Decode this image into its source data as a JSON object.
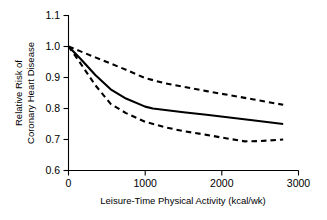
{
  "chart_data": {
    "type": "line",
    "title": "",
    "xlabel": "Leisure-Time Physical Activity (kcal/wk)",
    "ylabel": "Relative Risk of Coronary Heart Disease",
    "ylabel_line1": "Relative Risk of",
    "ylabel_line2": "Coronary Heart Disease",
    "xlim": [
      0,
      3000
    ],
    "ylim": [
      0.6,
      1.1
    ],
    "xticks": [
      0,
      1000,
      2000,
      3000
    ],
    "xticklabels": [
      "0",
      "1000",
      "2000",
      "3000"
    ],
    "yticks": [
      0.6,
      0.7,
      0.8,
      0.9,
      1.0,
      1.1
    ],
    "yticklabels": [
      "0.6",
      "0.7",
      "0.8",
      "0.9",
      "1.0",
      "1.1"
    ],
    "grid": false,
    "legend": "none",
    "line_color": "#000000",
    "series": [
      {
        "name": "Upper 95% confidence limit",
        "style": "dashed",
        "x": [
          0,
          150,
          350,
          550,
          750,
          1000,
          1250,
          1500,
          1800,
          2100,
          2400,
          2800
        ],
        "values": [
          1.0,
          0.985,
          0.965,
          0.945,
          0.925,
          0.898,
          0.882,
          0.87,
          0.856,
          0.843,
          0.83,
          0.812
        ]
      },
      {
        "name": "Relative risk (point estimate)",
        "style": "solid",
        "x": [
          0,
          150,
          350,
          550,
          750,
          1000,
          1100,
          1500,
          1800,
          2100,
          2400,
          2800
        ],
        "values": [
          1.0,
          0.962,
          0.908,
          0.862,
          0.832,
          0.806,
          0.8,
          0.788,
          0.78,
          0.771,
          0.762,
          0.75
        ]
      },
      {
        "name": "Lower 95% confidence limit",
        "style": "dashed",
        "x": [
          0,
          150,
          350,
          550,
          750,
          1000,
          1250,
          1500,
          1800,
          2100,
          2300,
          2500,
          2800
        ],
        "values": [
          1.0,
          0.948,
          0.875,
          0.815,
          0.785,
          0.757,
          0.74,
          0.727,
          0.715,
          0.702,
          0.694,
          0.695,
          0.7
        ]
      }
    ]
  }
}
